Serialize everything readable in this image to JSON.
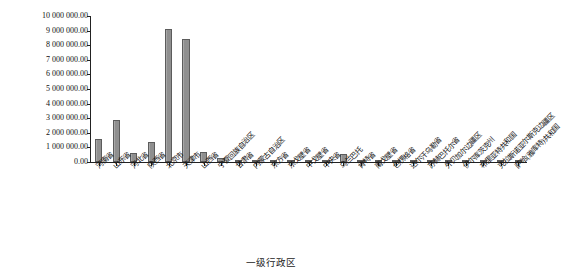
{
  "chart_data": {
    "type": "bar",
    "title": "",
    "xlabel": "一级行政区",
    "ylabel": "GDP平均密度/(美元/km²)",
    "ylim": [
      0,
      10000000
    ],
    "grid": false,
    "legend": "none",
    "ytick_labels": [
      "10 000 000.00",
      "9 000 000.00",
      "8 000 000.00",
      "7 000 000.00",
      "6 000 000.00",
      "5 000 000.00",
      "4 000 000.00",
      "3 000 000.00",
      "2 000 000.00",
      "1 000 000.00",
      "0.00"
    ],
    "ytick_values": [
      10000000,
      9000000,
      8000000,
      7000000,
      6000000,
      5000000,
      4000000,
      3000000,
      2000000,
      1000000,
      0
    ],
    "categories": [
      "河南省",
      "山东省",
      "河北省",
      "陕西省",
      "北京市",
      "天津市",
      "山西省",
      "宁夏回族自治区",
      "甘肃省",
      "内蒙古自治区",
      "东方省",
      "东戈壁省",
      "中戈壁省",
      "中央省",
      "乌兰巴托",
      "肯特省",
      "南戈壁省",
      "色楞格省",
      "达尔汗乌勒省",
      "苏赫巴托尔省",
      "外贝加尔边疆区",
      "伊尔库茨克州",
      "布里亚特共和国",
      "克拉斯诺亚尔斯克边疆区",
      "萨哈(雅库特)共和国"
    ],
    "values": [
      1600000,
      2900000,
      600000,
      1400000,
      9100000,
      8400000,
      700000,
      300000,
      150000,
      120000,
      60000,
      40000,
      35000,
      50000,
      520000,
      45000,
      40000,
      70000,
      90000,
      55000,
      30000,
      25000,
      20000,
      15000,
      10000
    ],
    "bar_color": "#8f8f8f",
    "bar_edge_color": "#5c5c5c",
    "axis_color": "#222222"
  }
}
